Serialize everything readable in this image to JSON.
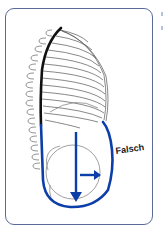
{
  "figure": {
    "label": "Falsch",
    "colors": {
      "frame": "#5a6a9a",
      "arrow": "#0b3ea8",
      "spine": "#111111",
      "ribs": "#555555"
    },
    "elements": [
      "ribcage",
      "spine",
      "abdomen-outline",
      "downward-arrow",
      "rightward-arrow"
    ]
  }
}
